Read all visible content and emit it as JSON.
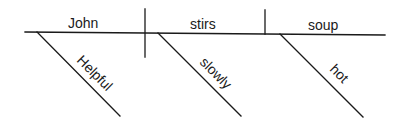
{
  "diagram": {
    "type": "sentence-diagram",
    "sentence": "Helpful John stirs soup hot slowly",
    "subject": {
      "word": "John",
      "modifier": "Helpful"
    },
    "verb": {
      "word": "stirs",
      "modifier": "slowly"
    },
    "object": {
      "word": "soup",
      "modifier": "hot"
    },
    "line_color": "#1a1a1a"
  }
}
